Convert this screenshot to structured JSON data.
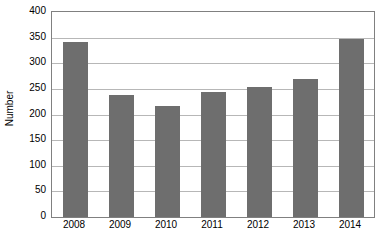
{
  "chart_data": {
    "type": "bar",
    "title": "",
    "subtitle": "",
    "xlabel": "",
    "ylabel": "Number",
    "categories": [
      "2008",
      "2009",
      "2010",
      "2011",
      "2012",
      "2013",
      "2014"
    ],
    "values": [
      341,
      238,
      217,
      244,
      254,
      269,
      347
    ],
    "series": [
      {
        "name": "Number",
        "values": [
          341,
          238,
          217,
          244,
          254,
          269,
          347
        ],
        "color": "#6e6e6e"
      }
    ],
    "ylim": [
      0,
      400
    ],
    "y_ticks": [
      0,
      50,
      100,
      150,
      200,
      250,
      300,
      350,
      400
    ],
    "y_tick_labels": [
      "0",
      "50",
      "100",
      "150",
      "200",
      "250",
      "300",
      "350",
      "400"
    ],
    "grid": true,
    "grid_axis": "y",
    "legend": false,
    "legend_position": "none",
    "annotations": [],
    "colors": {
      "bar": "#6e6e6e",
      "gridline": "#b7b7b7",
      "axis": "#808080",
      "text": "#000000",
      "background": "#ffffff"
    }
  }
}
